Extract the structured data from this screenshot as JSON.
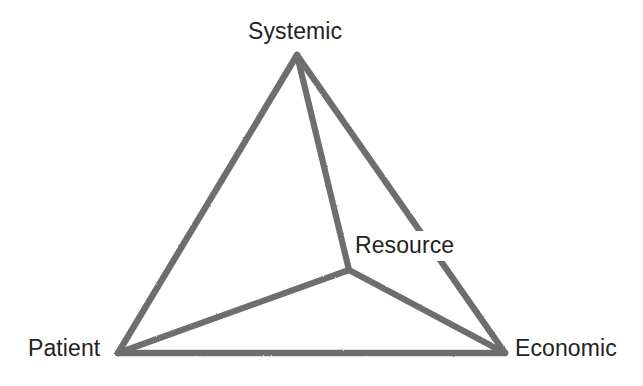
{
  "figure": {
    "background_color": "#ffffff",
    "line_color": "#6e6e6e",
    "line_width_px": 6,
    "text_color": "#232323",
    "width_px": 643,
    "height_px": 386
  },
  "chart_data": {
    "type": "diagram",
    "subtype": "node-link-network",
    "title": "",
    "nodes": [
      {
        "id": "systemic",
        "label": "Systemic",
        "x": 297,
        "y": 55,
        "label_x": 248,
        "label_y": 20,
        "label_anchor": "above",
        "interior": false
      },
      {
        "id": "patient",
        "label": "Patient",
        "x": 118,
        "y": 353,
        "label_x": 28,
        "label_y": 337,
        "label_anchor": "left",
        "interior": false
      },
      {
        "id": "economic",
        "label": "Economic",
        "x": 505,
        "y": 353,
        "label_x": 515,
        "label_y": 337,
        "label_anchor": "right",
        "interior": false
      },
      {
        "id": "resource",
        "label": "Resource",
        "x": 349,
        "y": 270,
        "label_x": 355,
        "label_y": 234,
        "label_anchor": "upper-right",
        "interior": true
      }
    ],
    "edges": [
      {
        "id": "systemic-patient",
        "from": "systemic",
        "to": "patient",
        "kind": "outer"
      },
      {
        "id": "systemic-economic",
        "from": "systemic",
        "to": "economic",
        "kind": "outer"
      },
      {
        "id": "patient-economic",
        "from": "patient",
        "to": "economic",
        "kind": "outer"
      },
      {
        "id": "systemic-resource",
        "from": "systemic",
        "to": "resource",
        "kind": "spoke"
      },
      {
        "id": "patient-resource",
        "from": "patient",
        "to": "resource",
        "kind": "spoke"
      },
      {
        "id": "economic-resource",
        "from": "economic",
        "to": "resource",
        "kind": "spoke"
      }
    ],
    "legend": [],
    "annotations": []
  }
}
